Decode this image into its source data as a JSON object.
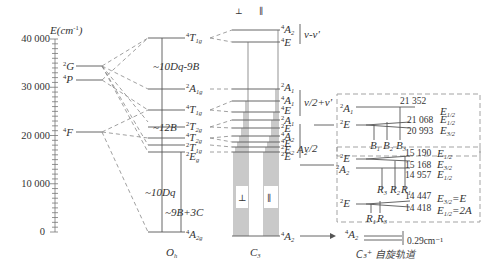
{
  "axis": {
    "label": "E(cm⁻¹)",
    "ticks": [
      "40 000",
      "30 000",
      "20 000",
      "10 000",
      "0"
    ]
  },
  "free_ion_terms": [
    {
      "sup": "2",
      "term": "G"
    },
    {
      "sup": "4",
      "term": "P"
    },
    {
      "sup": "4",
      "term": "F"
    }
  ],
  "oh_levels": [
    {
      "sup": "4",
      "term": "T",
      "sub": "1g"
    },
    {
      "sup": "2",
      "term": "A",
      "sub": "1g"
    },
    {
      "sup": "4",
      "term": "T",
      "sub": "1g"
    },
    {
      "sup": "2",
      "term": "T",
      "sub": "2g"
    },
    {
      "sup": "4",
      "term": "T",
      "sub": "2g"
    },
    {
      "sup": "2",
      "term": "T",
      "sub": "1g"
    },
    {
      "sup": "2",
      "term": "E",
      "sub": "g"
    },
    {
      "sup": "4",
      "term": "A",
      "sub": "2g"
    }
  ],
  "oh_annotations": [
    "~10Dq-9B",
    "~12B",
    "~10Dq",
    "~9B+3C"
  ],
  "c3_levels": [
    {
      "sup": "4",
      "term": "A",
      "sub": "2"
    },
    {
      "sup": "4",
      "term": "E",
      "sub": ""
    },
    {
      "sup": "2",
      "term": "A",
      "sub": "1"
    },
    {
      "sup": "4",
      "term": "A",
      "sub": "1"
    },
    {
      "sup": "4",
      "term": "E",
      "sub": ""
    },
    {
      "sup": "2",
      "term": "A",
      "sub": "1"
    },
    {
      "sup": "2",
      "term": "E",
      "sub": ""
    },
    {
      "sup": "4",
      "term": "A",
      "sub": "2"
    },
    {
      "sup": "4",
      "term": "E",
      "sub": ""
    },
    {
      "sup": "2",
      "term": "E",
      "sub": ""
    },
    {
      "sup": "2",
      "term": "E",
      "sub": ""
    },
    {
      "sup": "4",
      "term": "A",
      "sub": "2"
    }
  ],
  "c3_extra_label": "A₂",
  "polarization_marks": [
    "⊥",
    "∥"
  ],
  "symmetry_labels": {
    "oh": "O",
    "oh_sub": "h",
    "c3": "C",
    "c3_sub": "3"
  },
  "brackets": [
    "ν-ν'",
    "ν/2+ν'",
    "ν/2"
  ],
  "detail_boxes": {
    "top": {
      "levels": [
        {
          "sup": "2",
          "term": "A",
          "sub": "1"
        },
        {
          "sup": "2",
          "term": "E",
          "sub": ""
        }
      ],
      "energies": [
        "21 352",
        "21 068",
        "20 993"
      ],
      "spin_orbit": [
        "E1/2",
        "E1/2",
        "E3/2"
      ],
      "transitions": [
        "B1",
        "B2",
        "B3"
      ]
    },
    "bottom": {
      "levels": [
        {
          "sup": "2",
          "term": "E",
          "sub": ""
        },
        {
          "sup": "2",
          "term": "A",
          "sub": "2"
        },
        {
          "sup": "2",
          "term": "E",
          "sub": ""
        }
      ],
      "energies": [
        "15 190",
        "15 168",
        "14 957",
        "14 447",
        "14 418"
      ],
      "spin_orbit": [
        "E1/2",
        "E3/2",
        "E1/2",
        "E3/2=E",
        "E1/2=2A"
      ],
      "transitions_upper": [
        "R3",
        "R2",
        "R1"
      ],
      "transitions_lower": [
        "R1",
        "R3"
      ]
    }
  },
  "ground": {
    "level": {
      "sup": "4",
      "term": "A",
      "sub": "2"
    },
    "splitting": "0.29cm⁻¹",
    "caption": "C₃⁺ 自旋轨道"
  }
}
